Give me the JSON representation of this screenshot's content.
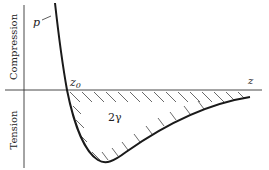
{
  "diagram": {
    "title": "",
    "labels": {
      "curve": "p",
      "zero_crossing": "z",
      "zero_crossing_subscript": "0",
      "x_axis": "z",
      "area": "2γ",
      "upper_region": "Compression",
      "lower_region": "Tension"
    },
    "colors": {
      "stroke": "#1a1a1a",
      "axis": "#333333",
      "hatch": "#444444",
      "text": "#222222",
      "background": "#ffffff"
    },
    "geometry": {
      "vertical_axis_x": 24,
      "horizontal_axis_y": 90,
      "zero_crossing_x": 67,
      "minimum_point": [
        103,
        163
      ]
    }
  }
}
